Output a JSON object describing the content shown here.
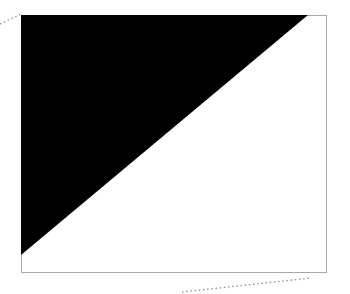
{
  "figure": {
    "width": 350,
    "height": 294,
    "background_color": "#ffffff",
    "title": "",
    "caption": ""
  },
  "frame": {
    "name": "plot-frame",
    "x": 21,
    "y": 15,
    "width": 305,
    "height": 257,
    "border_color": "#a8a8a8",
    "border_width": 1,
    "fill_color": "#ffffff"
  },
  "shapes": [
    {
      "name": "black-triangle",
      "type": "polygon",
      "fill_color": "#000000",
      "stroke": "none",
      "points": "21,15 308,15 21,255",
      "description": "right triangle occupying upper-left of frame, hypotenuse from lower-left to upper-right"
    }
  ],
  "guide_lines": [
    {
      "name": "top-left-dotted-guide",
      "type": "dotted-line",
      "x1": 0,
      "y1": 24,
      "x2": 21,
      "y2": 14,
      "color": "#999999",
      "dash": "1.6 2.6",
      "stroke_width": 1.4
    },
    {
      "name": "bottom-right-dotted-guide",
      "type": "dotted-line",
      "x1": 182,
      "y1": 292,
      "x2": 311,
      "y2": 278,
      "color": "#999999",
      "dash": "1.6 2.6",
      "stroke_width": 1.4
    }
  ],
  "chart_data": {
    "type": "area",
    "title": "",
    "xlabel": "",
    "ylabel": "",
    "grid": false,
    "legend": null,
    "xlim": [
      0,
      1
    ],
    "ylim": [
      0,
      1
    ],
    "series": [
      {
        "name": "black-region",
        "color": "#000000",
        "vertices_normalized": [
          [
            0,
            1
          ],
          [
            1,
            1
          ],
          [
            0,
            0.066
          ]
        ],
        "area_fraction": 0.402
      },
      {
        "name": "white-region",
        "color": "#ffffff",
        "vertices_normalized": [
          [
            0,
            0.066
          ],
          [
            1,
            1
          ],
          [
            1,
            0
          ],
          [
            0,
            0
          ]
        ],
        "area_fraction": 0.598
      }
    ],
    "annotations": [
      {
        "name": "top-left-dotted-guide",
        "text": ""
      },
      {
        "name": "bottom-right-dotted-guide",
        "text": ""
      }
    ]
  }
}
